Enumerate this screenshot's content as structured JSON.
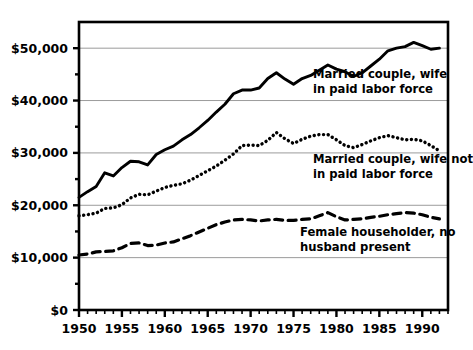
{
  "chart_data": {
    "type": "line",
    "title": "",
    "subtitle": "",
    "xlabel": "",
    "ylabel": "",
    "xlim": [
      1950,
      1993
    ],
    "ylim": [
      0,
      55000
    ],
    "grid": "horizontal",
    "legend_position": "inline-annotations",
    "y_ticks": [
      0,
      10000,
      20000,
      30000,
      40000,
      50000
    ],
    "y_tick_labels": [
      "$0",
      "$10,000",
      "$20,000",
      "$30,000",
      "$40,000",
      "$50,000"
    ],
    "x_ticks": [
      1950,
      1955,
      1960,
      1965,
      1970,
      1975,
      1980,
      1985,
      1990
    ],
    "x_tick_labels": [
      "1950",
      "1955",
      "1960",
      "1965",
      "1970",
      "1975",
      "1980",
      "1985",
      "1990"
    ],
    "x_minor_tick_interval": 1,
    "x": [
      1950,
      1951,
      1952,
      1953,
      1954,
      1955,
      1956,
      1957,
      1958,
      1959,
      1960,
      1961,
      1962,
      1963,
      1964,
      1965,
      1966,
      1967,
      1968,
      1969,
      1970,
      1971,
      1972,
      1973,
      1974,
      1975,
      1976,
      1977,
      1978,
      1979,
      1980,
      1981,
      1982,
      1983,
      1984,
      1985,
      1986,
      1987,
      1988,
      1989,
      1990,
      1991,
      1992
    ],
    "series": [
      {
        "name": "Married couple, wife in paid labor force",
        "style": "solid",
        "color": "#000000",
        "values": [
          21500,
          22600,
          23600,
          26200,
          25600,
          27200,
          28400,
          28300,
          27700,
          29700,
          30600,
          31300,
          32500,
          33500,
          34800,
          36200,
          37800,
          39300,
          41300,
          42000,
          42000,
          42400,
          44200,
          45300,
          44100,
          43100,
          44200,
          44800,
          45800,
          46800,
          46000,
          45500,
          44600,
          45300,
          46600,
          47900,
          49500,
          50000,
          50300,
          51100,
          50500,
          49800,
          50000
        ]
      },
      {
        "name": "Married couple, wife not in paid labor force",
        "style": "dotted",
        "color": "#000000",
        "values": [
          18000,
          18200,
          18500,
          19400,
          19500,
          20100,
          21400,
          22100,
          22000,
          22700,
          23400,
          23800,
          24100,
          24800,
          25700,
          26600,
          27500,
          28600,
          29800,
          31400,
          31500,
          31400,
          32400,
          33900,
          32700,
          31800,
          32600,
          33200,
          33500,
          33500,
          32500,
          31400,
          31000,
          31600,
          32300,
          32900,
          33300,
          32900,
          32500,
          32600,
          32300,
          31400,
          30400
        ]
      },
      {
        "name": "Female householder, no husband present",
        "style": "dashed",
        "color": "#000000",
        "values": [
          10500,
          10700,
          11100,
          11200,
          11300,
          11900,
          12700,
          12800,
          12300,
          12400,
          12800,
          13000,
          13600,
          14200,
          14900,
          15600,
          16300,
          16800,
          17200,
          17300,
          17200,
          17000,
          17200,
          17300,
          17100,
          17100,
          17300,
          17400,
          18000,
          18600,
          17800,
          17200,
          17300,
          17400,
          17700,
          17900,
          18200,
          18400,
          18600,
          18500,
          18200,
          17700,
          17400
        ]
      }
    ],
    "annotations": [
      {
        "id": "annotation-married-wife-in-labor-force",
        "lines": [
          "Married couple, wife",
          "in paid labor force"
        ],
        "x": 313,
        "y": 78
      },
      {
        "id": "annotation-married-wife-not-in-labor-force",
        "lines": [
          "Married couple, wife not",
          "in paid labor force"
        ],
        "x": 313,
        "y": 163
      },
      {
        "id": "annotation-female-householder",
        "lines": [
          "Female householder, no",
          "husband present"
        ],
        "x": 300,
        "y": 236
      }
    ]
  }
}
